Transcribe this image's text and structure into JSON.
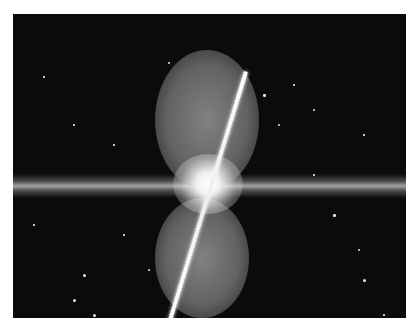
{
  "image": {
    "description": "Astronomical image of an edge-on galaxy disk with two bright bipolar lobes and a diagonal jet through the bright core, against a starfield",
    "background_color": "#0b0b0b",
    "stars": [
      [
        155,
        48,
        2
      ],
      [
        30,
        62,
        1.5
      ],
      [
        280,
        70,
        1.5
      ],
      [
        300,
        95,
        2
      ],
      [
        350,
        120,
        1.5
      ],
      [
        60,
        110,
        1.5
      ],
      [
        100,
        130,
        1.5
      ],
      [
        320,
        200,
        2.5
      ],
      [
        345,
        235,
        2
      ],
      [
        350,
        265,
        3
      ],
      [
        135,
        255,
        2
      ],
      [
        70,
        260,
        3
      ],
      [
        60,
        285,
        3
      ],
      [
        80,
        300,
        3
      ],
      [
        250,
        80,
        2.5
      ],
      [
        265,
        110,
        2
      ],
      [
        20,
        210,
        1.5
      ],
      [
        370,
        300,
        1.5
      ],
      [
        110,
        220,
        1.5
      ],
      [
        300,
        160,
        1.5
      ]
    ]
  }
}
